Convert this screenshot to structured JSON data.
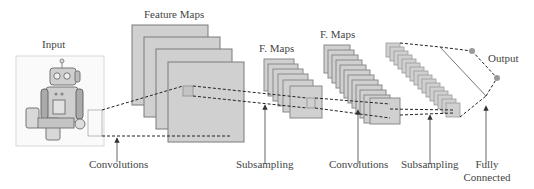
{
  "labels": {
    "input": "Input",
    "feature_maps": "Feature Maps",
    "f_maps_1": "F. Maps",
    "f_maps_2": "F. Maps",
    "output": "Output"
  },
  "stages": [
    {
      "label": "Convolutions"
    },
    {
      "label": "Subsampling"
    },
    {
      "label": "Convolutions"
    },
    {
      "label": "Subsampling"
    },
    {
      "label": "Fully",
      "label2": "Connected"
    }
  ],
  "colors": {
    "map_fill": "#d0d0d0",
    "map_stroke": "#8a8a8a",
    "line": "#333333",
    "node": "#999999"
  }
}
